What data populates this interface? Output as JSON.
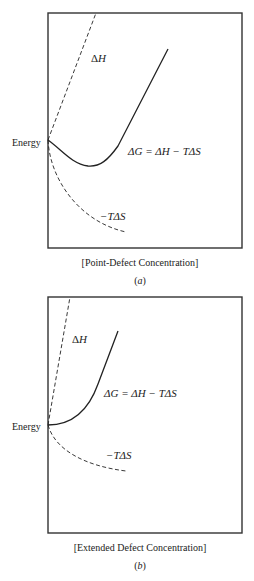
{
  "panels": [
    {
      "id": "a",
      "y_label": "Energy",
      "x_label": "[Point-Defect Concentration]",
      "caption": "(a)",
      "caption_letter": "a",
      "curves": {
        "enthalpy": {
          "label_delta": "Δ",
          "label_var": "H",
          "style": "dashed"
        },
        "gibbs": {
          "label": "ΔG = ΔH − TΔS",
          "style": "solid"
        },
        "entropy": {
          "label": "−TΔS",
          "style": "dashed"
        }
      }
    },
    {
      "id": "b",
      "y_label": "Energy",
      "x_label": "[Extended Defect Concentration]",
      "caption": "(b)",
      "caption_letter": "b",
      "curves": {
        "enthalpy": {
          "label_delta": "Δ",
          "label_var": "H",
          "style": "dashed"
        },
        "gibbs": {
          "label": "ΔG = ΔH − TΔS",
          "style": "solid"
        },
        "entropy": {
          "label": "−TΔS",
          "style": "dashed"
        }
      }
    }
  ],
  "colors": {
    "line": "#222222",
    "frame": "#333333",
    "background": "#ffffff"
  }
}
